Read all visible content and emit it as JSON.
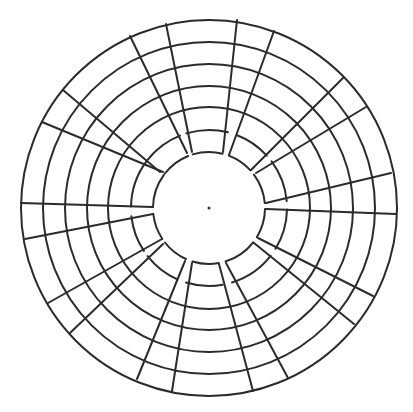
{
  "diagram": {
    "type": "circular-maze",
    "title": "",
    "center": [
      209,
      208
    ],
    "stroke_color": "#2b2b2b",
    "background": "#ffffff",
    "full_rings": [
      188,
      166,
      144,
      122,
      101
    ],
    "gapped_rings": [
      78,
      56
    ],
    "spokes": [
      {
        "from": [
          21,
          203
        ],
        "to": [
          153,
          207
        ]
      },
      {
        "from": [
          25,
          239
        ],
        "to": [
          153,
          214
        ]
      },
      {
        "from": [
          42,
          122
        ],
        "to": [
          163,
          172
        ]
      },
      {
        "from": [
          63,
          90
        ],
        "to": [
          160,
          172
        ]
      },
      {
        "from": [
          130,
          36
        ],
        "to": [
          187,
          153
        ]
      },
      {
        "from": [
          166,
          24
        ],
        "to": [
          192,
          152
        ]
      },
      {
        "from": [
          237,
          20
        ],
        "to": [
          223,
          152
        ]
      },
      {
        "from": [
          274,
          31
        ],
        "to": [
          229,
          155
        ]
      },
      {
        "from": [
          343,
          78
        ],
        "to": [
          251,
          170
        ]
      },
      {
        "from": [
          366,
          107
        ],
        "to": [
          256,
          173
        ]
      },
      {
        "from": [
          391,
          173
        ],
        "to": [
          266,
          203
        ]
      },
      {
        "from": [
          396,
          214
        ],
        "to": [
          266,
          209
        ]
      },
      {
        "from": [
          373,
          296
        ],
        "to": [
          258,
          238
        ]
      },
      {
        "from": [
          354,
          324
        ],
        "to": [
          254,
          243
        ]
      },
      {
        "from": [
          288,
          378
        ],
        "to": [
          226,
          263
        ]
      },
      {
        "from": [
          253,
          391
        ],
        "to": [
          219,
          264
        ]
      },
      {
        "from": [
          172,
          391
        ],
        "to": [
          192,
          263
        ]
      },
      {
        "from": [
          137,
          379
        ],
        "to": [
          185,
          261
        ]
      },
      {
        "from": [
          70,
          333
        ],
        "to": [
          163,
          244
        ]
      },
      {
        "from": [
          48,
          303
        ],
        "to": [
          162,
          239
        ]
      }
    ],
    "center_dot": {
      "r": 1.5
    }
  }
}
